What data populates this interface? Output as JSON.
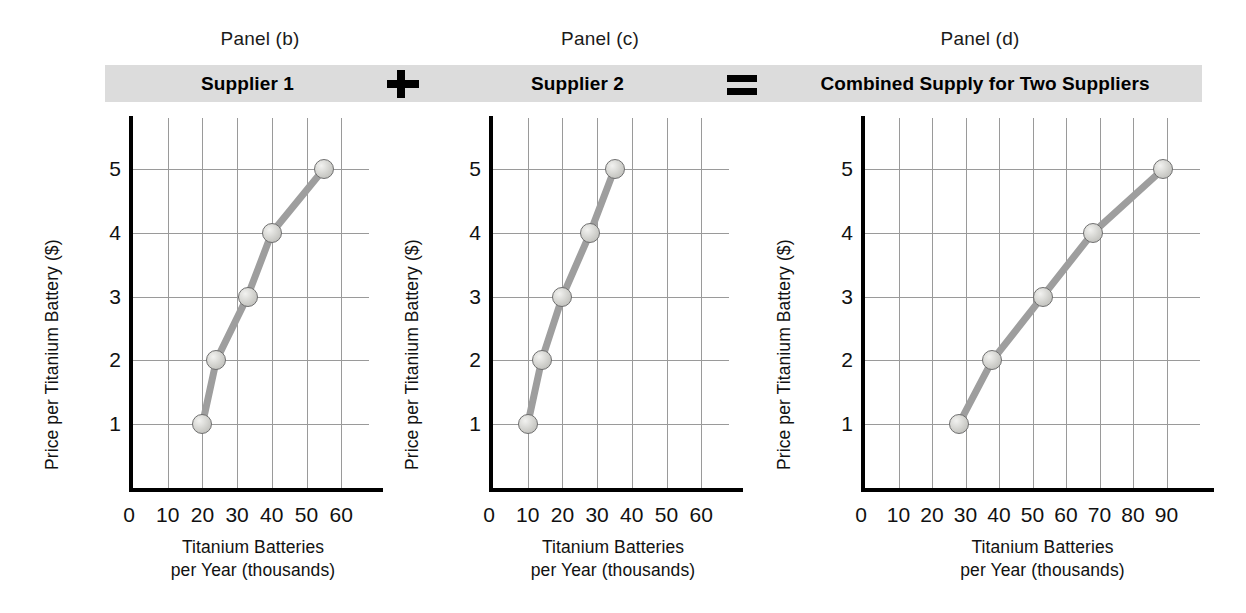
{
  "figure": {
    "panels": [
      {
        "caption": "Panel (b)",
        "bar_title": "Supplier 1",
        "operator_after": "plus"
      },
      {
        "caption": "Panel (c)",
        "bar_title": "Supplier 2",
        "operator_after": "equals"
      },
      {
        "caption": "Panel (d)",
        "bar_title": "Combined Supply for Two Suppliers",
        "operator_after": ""
      }
    ],
    "operators": {
      "plus": "+",
      "equals": "="
    },
    "colors": {
      "bar_background": "#dcdcdc",
      "curve": "#9e9e9e",
      "marker_fill": "#d0d0cc",
      "marker_edge": "#6f6f6f",
      "grid": "#9a9a9a",
      "axis": "#000000",
      "text": "#111111"
    }
  },
  "chart_data": [
    {
      "type": "line",
      "title": "Supplier 1",
      "panel": "Panel (b)",
      "xlabel": "Titanium Batteries per Year (thousands)",
      "ylabel": "Price per Titanium Battery ($)",
      "xlabel_line1": "Titanium Batteries",
      "xlabel_line2": "per Year (thousands)",
      "xticks": [
        0,
        10,
        20,
        30,
        40,
        50,
        60
      ],
      "yticks": [
        1,
        2,
        3,
        4,
        5
      ],
      "xlim": [
        0,
        68
      ],
      "ylim": [
        0,
        5.8
      ],
      "grid": true,
      "legend": "none",
      "x": [
        20,
        24,
        33,
        40,
        55
      ],
      "y": [
        1,
        2,
        3,
        4,
        5
      ]
    },
    {
      "type": "line",
      "title": "Supplier 2",
      "panel": "Panel (c)",
      "xlabel": "Titanium Batteries per Year (thousands)",
      "ylabel": "Price per Titanium Battery ($)",
      "xlabel_line1": "Titanium Batteries",
      "xlabel_line2": "per Year (thousands)",
      "xticks": [
        0,
        10,
        20,
        30,
        40,
        50,
        60
      ],
      "yticks": [
        1,
        2,
        3,
        4,
        5
      ],
      "xlim": [
        0,
        68
      ],
      "ylim": [
        0,
        5.8
      ],
      "grid": true,
      "legend": "none",
      "x": [
        10,
        14,
        20,
        28,
        35
      ],
      "y": [
        1,
        2,
        3,
        4,
        5
      ]
    },
    {
      "type": "line",
      "title": "Combined Supply for Two Suppliers",
      "panel": "Panel (d)",
      "xlabel": "Titanium Batteries per Year (thousands)",
      "ylabel": "Price per Titanium Battery ($)",
      "xlabel_line1": "Titanium Batteries",
      "xlabel_line2": "per Year (thousands)",
      "xticks": [
        0,
        10,
        20,
        30,
        40,
        50,
        60,
        70,
        80,
        90
      ],
      "yticks": [
        1,
        2,
        3,
        4,
        5
      ],
      "xlim": [
        0,
        100
      ],
      "ylim": [
        0,
        5.8
      ],
      "grid": true,
      "legend": "none",
      "x": [
        28,
        38,
        53,
        68,
        89
      ],
      "y": [
        1,
        2,
        3,
        4,
        5
      ]
    }
  ]
}
